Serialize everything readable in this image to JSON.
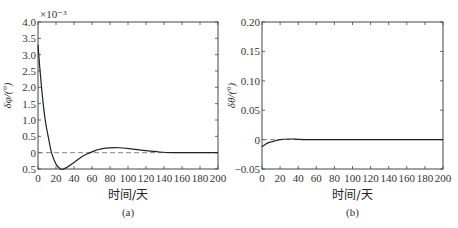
{
  "chart_data": [
    {
      "type": "line",
      "panel_caption": "(a)",
      "title": "",
      "xlabel": "时间/天",
      "ylabel": "δφ/(°)",
      "y_scale_note": "×10⁻³",
      "xlim": [
        0,
        200
      ],
      "ylim": [
        -0.5,
        4.0
      ],
      "x_ticks": [
        0,
        20,
        40,
        60,
        80,
        100,
        120,
        140,
        160,
        180,
        200
      ],
      "y_ticks": [
        -0.5,
        0,
        0.5,
        1.0,
        1.5,
        2.0,
        2.5,
        3.0,
        3.5,
        4.0
      ],
      "y_tick_labels": [
        "0.5",
        "0",
        "0.5",
        "1.0",
        "1.5",
        "2.0",
        "2.5",
        "3.0",
        "3.5",
        "4.0"
      ],
      "grid": false,
      "reference_line": {
        "y": 0,
        "style": "dashed"
      },
      "series": [
        {
          "name": "δφ",
          "x": [
            0,
            2,
            5,
            8,
            12,
            15,
            20,
            25,
            28,
            32,
            40,
            50,
            58,
            65,
            75,
            90,
            105,
            120,
            135,
            150,
            170,
            200
          ],
          "values": [
            3.3,
            2.6,
            1.7,
            1.0,
            0.4,
            0.0,
            -0.35,
            -0.5,
            -0.5,
            -0.45,
            -0.3,
            -0.1,
            0.0,
            0.08,
            0.14,
            0.15,
            0.11,
            0.06,
            0.02,
            0.0,
            0.0,
            0.0
          ]
        }
      ]
    },
    {
      "type": "line",
      "panel_caption": "(b)",
      "title": "",
      "xlabel": "时间/天",
      "ylabel": "δθ/(°)",
      "xlim": [
        0,
        200
      ],
      "ylim": [
        -0.05,
        0.2
      ],
      "x_ticks": [
        0,
        20,
        40,
        60,
        80,
        100,
        120,
        140,
        160,
        180,
        200
      ],
      "y_ticks": [
        -0.05,
        0,
        0.05,
        0.1,
        0.15,
        0.2
      ],
      "y_tick_labels": [
        "−0.05",
        "0",
        "0.05",
        "0.10",
        "0.15",
        "0.20"
      ],
      "grid": false,
      "reference_line": {
        "y": 0,
        "style": "dashed"
      },
      "series": [
        {
          "name": "δθ",
          "x": [
            0,
            3,
            6,
            10,
            15,
            20,
            30,
            40,
            50,
            100,
            200
          ],
          "values": [
            -0.012,
            -0.009,
            -0.006,
            -0.004,
            -0.002,
            0.0,
            0.001,
            0.0005,
            0.0,
            0.0,
            0.0
          ]
        }
      ]
    }
  ]
}
